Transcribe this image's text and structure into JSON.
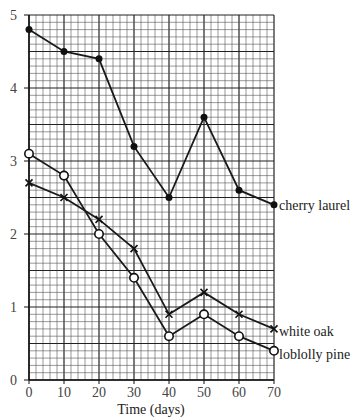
{
  "chart_data": {
    "type": "line",
    "title": "",
    "xlabel": "Time (days)",
    "ylabel": "",
    "x": [
      0,
      10,
      20,
      30,
      40,
      50,
      60,
      70
    ],
    "xlim": [
      0,
      70
    ],
    "ylim": [
      0,
      5
    ],
    "x_ticks": [
      "0",
      "10",
      "20",
      "30",
      "40",
      "50",
      "60",
      "70"
    ],
    "y_ticks": [
      "0",
      "1",
      "2",
      "3",
      "4",
      "5"
    ],
    "grid": true,
    "legend_position": "line-end labels",
    "series": [
      {
        "name": "cherry laurel",
        "marker": "filled-circle",
        "values": [
          4.8,
          4.5,
          4.4,
          3.2,
          2.5,
          3.6,
          2.6,
          2.4
        ]
      },
      {
        "name": "white oak",
        "marker": "x",
        "values": [
          2.7,
          2.5,
          2.2,
          1.8,
          0.9,
          1.2,
          0.9,
          0.7
        ]
      },
      {
        "name": "loblolly pine",
        "marker": "open-circle",
        "values": [
          3.1,
          2.8,
          2.0,
          1.4,
          0.6,
          0.9,
          0.6,
          0.4
        ]
      }
    ]
  }
}
